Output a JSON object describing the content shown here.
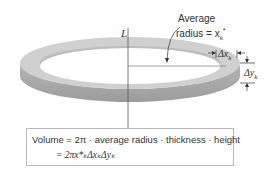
{
  "labels": {
    "axis": "L",
    "avg_radius_line1": "Average",
    "avg_radius_line2": "radius = x",
    "avg_radius_sub": "k",
    "avg_radius_sup": "*",
    "dx": "Δx",
    "dx_sub": "k",
    "dy": "Δy",
    "dy_sub": "k"
  },
  "formula": {
    "line1": "Volume = 2π · average radius · thickness · height",
    "line2": "= 2πx*ₖΔxₖΔyₖ"
  },
  "colors": {
    "ring_top": "#d2d2d2",
    "ring_side": "#a9a9a9",
    "text": "#333333"
  }
}
